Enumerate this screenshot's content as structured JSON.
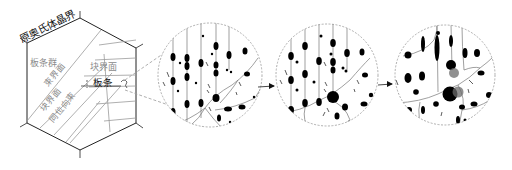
{
  "diagram": {
    "type": "martensite-microstructure-schematic",
    "labels": {
      "prior_austenite_grain_boundary": "原奥氏体晶界",
      "lath_group": "板条群",
      "packet_boundary": "束界面",
      "block_boundary_top": "块界面",
      "lath": "板条",
      "lath_marker": "C",
      "block_boundary_lower": "块界面",
      "same_orientation_bundle": "同位向束"
    },
    "colors": {
      "outline": "#222222",
      "inner_lines": "#9a9a9a",
      "gray_text": "#8a8a8a",
      "dark_text": "#111111",
      "precipitate": "#000000",
      "precipitate_gray": "#6b6b6b",
      "dashed": "#9a9a9a"
    },
    "stages": [
      {
        "id": "stage-1",
        "description": "zoomed region with fine elongated precipitates along laths"
      },
      {
        "id": "stage-2",
        "description": "coarsened precipitates, larger particle at triple junction"
      },
      {
        "id": "stage-3",
        "description": "further coarsened precipitates, large gray particles"
      }
    ],
    "arrows": [
      {
        "from": "stage-1",
        "to": "stage-2"
      },
      {
        "from": "stage-2",
        "to": "stage-3"
      }
    ]
  }
}
